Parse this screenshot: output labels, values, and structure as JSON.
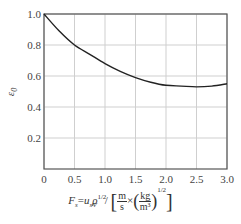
{
  "chart_data": {
    "type": "line",
    "title": "",
    "xlabel": "F_s = u_s ρ_V^{1/2} / [m/s × (kg/m^3)^{1/2}]",
    "ylabel": "ε_0",
    "xlim": [
      0,
      3.0
    ],
    "ylim": [
      0,
      1.0
    ],
    "x_ticks": [
      "0",
      "0.5",
      "1.0",
      "1.5",
      "2.0",
      "2.5",
      "3.0"
    ],
    "y_ticks": [
      "0.2",
      "0.4",
      "0.6",
      "0.8",
      "1.0"
    ],
    "grid": true,
    "legend": null,
    "series": [
      {
        "name": "ε_0",
        "x": [
          0,
          0.25,
          0.5,
          0.75,
          1.0,
          1.25,
          1.5,
          1.75,
          2.0,
          2.25,
          2.5,
          2.75,
          3.0
        ],
        "y": [
          1.0,
          0.89,
          0.8,
          0.74,
          0.68,
          0.63,
          0.59,
          0.56,
          0.54,
          0.535,
          0.53,
          0.535,
          0.55
        ]
      }
    ]
  },
  "labels": {
    "ylabel_main": "ε",
    "ylabel_sub": "0",
    "x_F": "F",
    "x_F_sub": "s",
    "x_eq": "=",
    "x_u": "u",
    "x_u_sub": "s",
    "x_rho": "ρ",
    "x_rho_sub": "V",
    "x_rho_sup": "1/2",
    "x_slash": "/",
    "x_m": "m",
    "x_s": "s",
    "x_times": "×",
    "x_kg": "kg",
    "x_m3": "m³",
    "x_half": "1/2"
  }
}
